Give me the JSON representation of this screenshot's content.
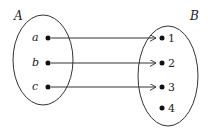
{
  "diagram": {
    "type": "mapping",
    "set_a": {
      "label": "A",
      "elements": [
        "a",
        "b",
        "c"
      ]
    },
    "set_b": {
      "label": "B",
      "elements": [
        "1",
        "2",
        "3",
        "4"
      ]
    },
    "mappings": [
      {
        "from": "a",
        "to": "1"
      },
      {
        "from": "b",
        "to": "2"
      },
      {
        "from": "c",
        "to": "3"
      }
    ]
  }
}
